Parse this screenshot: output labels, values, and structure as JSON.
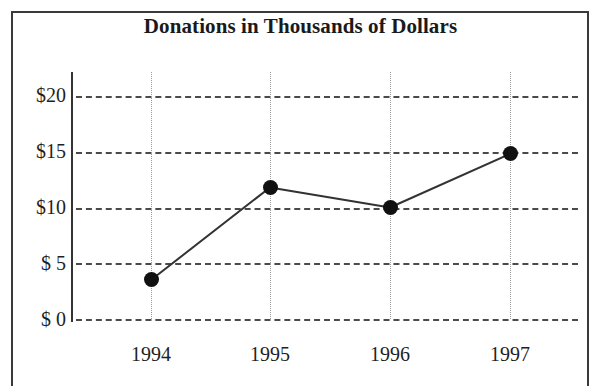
{
  "chart_data": {
    "type": "line",
    "title": "Donations in Thousands of Dollars",
    "xlabel": "",
    "ylabel": "",
    "categories": [
      "1994",
      "1995",
      "1996",
      "1997"
    ],
    "values": [
      3.5,
      11.8,
      10.0,
      14.8
    ],
    "series": [
      {
        "name": "Donations",
        "values": [
          3.5,
          11.8,
          10.0,
          14.8
        ]
      }
    ],
    "ylim": [
      0,
      20
    ],
    "yticks": [
      0,
      5,
      10,
      15,
      20
    ],
    "ytick_labels": [
      "$ 0",
      "$ 5",
      "$10",
      "$15",
      "$20"
    ],
    "xtick_labels": [
      "1994",
      "1995",
      "1996",
      "1997"
    ],
    "grid": "horizontal dashed, vertical dotted",
    "legend": "none",
    "marker": "filled circle",
    "line_color": "#333333",
    "marker_color": "#111111",
    "grid_color": "#4a4a4a",
    "units": "thousands of dollars"
  },
  "axes": {
    "y_ticks": [
      {
        "label": "$20",
        "value": 20
      },
      {
        "label": "$15",
        "value": 15
      },
      {
        "label": "$10",
        "value": 10
      },
      {
        "label": "$ 5",
        "value": 5
      },
      {
        "label": "$ 0",
        "value": 0
      }
    ],
    "x_ticks": [
      {
        "label": "1994"
      },
      {
        "label": "1995"
      },
      {
        "label": "1996"
      },
      {
        "label": "1997"
      }
    ]
  }
}
